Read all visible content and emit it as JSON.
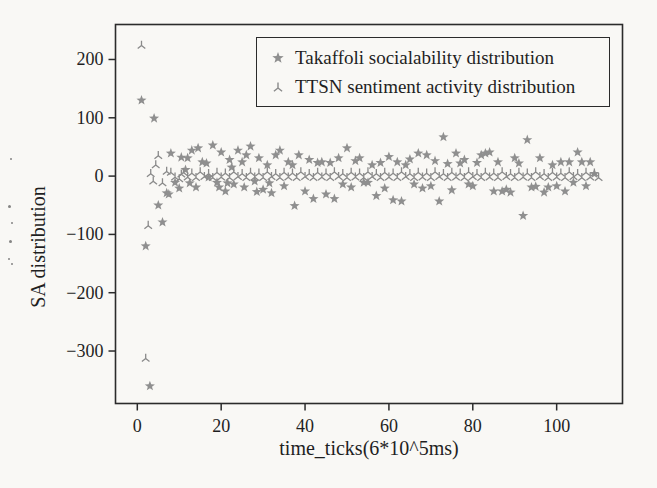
{
  "figure": {
    "background": "#f9f8f5",
    "axis_color": "#2b2b2b",
    "text_color": "#1f1f1f"
  },
  "chart_data": {
    "type": "scatter",
    "title": "",
    "xlabel": "time_ticks(6*10^5ms)",
    "ylabel": "SA distribution",
    "xlim": [
      -5.2,
      115.7
    ],
    "ylim": [
      -390,
      260
    ],
    "xticks": [
      0,
      20,
      40,
      60,
      80,
      100
    ],
    "yticks": [
      200,
      100,
      0,
      -100,
      -200,
      -300
    ],
    "grid": false,
    "legend_position": "upper right",
    "series": [
      {
        "name": "Takaffoli socialability distribution",
        "marker": "star",
        "color": "#8f8f8f",
        "points": [
          [
            1,
            130
          ],
          [
            2,
            -120
          ],
          [
            3,
            -360
          ],
          [
            4,
            99
          ],
          [
            5,
            -50
          ],
          [
            6,
            -79
          ],
          [
            7,
            -29
          ],
          [
            7.5,
            -31
          ],
          [
            8,
            39
          ],
          [
            9,
            -11
          ],
          [
            10,
            -21
          ],
          [
            10.5,
            32
          ],
          [
            11.5,
            11
          ],
          [
            12,
            31
          ],
          [
            12.5,
            -12
          ],
          [
            13,
            44
          ],
          [
            14,
            -19
          ],
          [
            14.5,
            48
          ],
          [
            15.5,
            24
          ],
          [
            16.5,
            22
          ],
          [
            17,
            -2
          ],
          [
            18,
            53
          ],
          [
            19,
            -11
          ],
          [
            19.5,
            -19
          ],
          [
            20,
            41
          ],
          [
            21,
            -26
          ],
          [
            21.5,
            -12
          ],
          [
            22,
            28
          ],
          [
            22.5,
            15
          ],
          [
            23,
            -14
          ],
          [
            24,
            44
          ],
          [
            25,
            24
          ],
          [
            25.5,
            -19
          ],
          [
            26,
            36
          ],
          [
            27,
            51
          ],
          [
            28,
            -9
          ],
          [
            28.5,
            -27
          ],
          [
            29,
            31
          ],
          [
            30,
            -23
          ],
          [
            31,
            19
          ],
          [
            31.5,
            -12
          ],
          [
            32,
            -29
          ],
          [
            33,
            36
          ],
          [
            34,
            44
          ],
          [
            35,
            -17
          ],
          [
            36,
            24
          ],
          [
            37,
            19
          ],
          [
            37.5,
            -51
          ],
          [
            38.5,
            36
          ],
          [
            40,
            -26
          ],
          [
            41,
            28
          ],
          [
            42,
            -39
          ],
          [
            43,
            23
          ],
          [
            44,
            24
          ],
          [
            45,
            -31
          ],
          [
            46,
            23
          ],
          [
            47,
            -39
          ],
          [
            48,
            31
          ],
          [
            49,
            -14
          ],
          [
            50,
            48
          ],
          [
            51,
            -19
          ],
          [
            52,
            26
          ],
          [
            53,
            31
          ],
          [
            54,
            -11
          ],
          [
            55,
            -11
          ],
          [
            56,
            19
          ],
          [
            57,
            -34
          ],
          [
            58,
            23
          ],
          [
            59,
            -21
          ],
          [
            60,
            33
          ],
          [
            61,
            -41
          ],
          [
            62,
            24
          ],
          [
            63,
            -43
          ],
          [
            64,
            19
          ],
          [
            65,
            29
          ],
          [
            66,
            -14
          ],
          [
            67,
            39
          ],
          [
            68,
            -21
          ],
          [
            69,
            36
          ],
          [
            70,
            -17
          ],
          [
            71,
            26
          ],
          [
            72,
            -43
          ],
          [
            73,
            67
          ],
          [
            74,
            21
          ],
          [
            75,
            -24
          ],
          [
            76,
            39
          ],
          [
            77,
            22
          ],
          [
            78,
            28
          ],
          [
            79,
            -14
          ],
          [
            80,
            -17
          ],
          [
            81,
            23
          ],
          [
            82,
            36
          ],
          [
            83,
            39
          ],
          [
            84,
            41
          ],
          [
            85,
            -26
          ],
          [
            86,
            24
          ],
          [
            87,
            -26
          ],
          [
            88,
            -23
          ],
          [
            89,
            -28
          ],
          [
            90,
            31
          ],
          [
            91,
            22
          ],
          [
            92,
            -68
          ],
          [
            93,
            62
          ],
          [
            94,
            -19
          ],
          [
            95,
            -18
          ],
          [
            96,
            31
          ],
          [
            97,
            -28
          ],
          [
            98,
            -19
          ],
          [
            99,
            19
          ],
          [
            100,
            -17
          ],
          [
            101,
            24
          ],
          [
            102,
            -26
          ],
          [
            103,
            24
          ],
          [
            104,
            -11
          ],
          [
            105,
            41
          ],
          [
            106,
            24
          ],
          [
            107,
            -17
          ],
          [
            108,
            24
          ],
          [
            109,
            4
          ]
        ]
      },
      {
        "name": "TTSN sentiment activity distribution",
        "marker": "tri_up",
        "color": "#8a8a8a",
        "points": [
          [
            1,
            224
          ],
          [
            2,
            -313
          ],
          [
            2.6,
            -85
          ],
          [
            3.2,
            4
          ],
          [
            3.8,
            -9
          ],
          [
            4.4,
            19
          ],
          [
            5,
            35
          ],
          [
            6,
            -12
          ],
          [
            7,
            8
          ],
          [
            8,
            6
          ],
          [
            9,
            -2
          ],
          [
            10,
            -5
          ],
          [
            10.5,
            3
          ],
          [
            11,
            6
          ],
          [
            12,
            -2
          ],
          [
            13,
            5
          ],
          [
            14,
            -3
          ],
          [
            15,
            7
          ],
          [
            16,
            -1
          ],
          [
            17,
            4
          ],
          [
            18,
            -3
          ],
          [
            19,
            6
          ],
          [
            20,
            -2
          ],
          [
            21,
            5
          ],
          [
            22,
            -3
          ],
          [
            23,
            7
          ],
          [
            24,
            -1
          ],
          [
            25,
            4
          ],
          [
            26,
            -3
          ],
          [
            27,
            6
          ],
          [
            28,
            -2
          ],
          [
            29,
            5
          ],
          [
            30,
            -3
          ],
          [
            31,
            7
          ],
          [
            32,
            -1
          ],
          [
            33,
            4
          ],
          [
            34,
            -3
          ],
          [
            35,
            6
          ],
          [
            36,
            -2
          ],
          [
            37,
            5
          ],
          [
            38,
            -3
          ],
          [
            39,
            7
          ],
          [
            40,
            -1
          ],
          [
            41,
            4
          ],
          [
            42,
            -3
          ],
          [
            43,
            6
          ],
          [
            44,
            -2
          ],
          [
            45,
            5
          ],
          [
            46,
            -3
          ],
          [
            47,
            7
          ],
          [
            48,
            -1
          ],
          [
            49,
            4
          ],
          [
            50,
            -3
          ],
          [
            51,
            6
          ],
          [
            52,
            -2
          ],
          [
            53,
            5
          ],
          [
            54,
            -3
          ],
          [
            55,
            7
          ],
          [
            56,
            -1
          ],
          [
            57,
            4
          ],
          [
            58,
            -3
          ],
          [
            59,
            6
          ],
          [
            60,
            -2
          ],
          [
            61,
            5
          ],
          [
            62,
            -3
          ],
          [
            63,
            7
          ],
          [
            64,
            -1
          ],
          [
            65,
            4
          ],
          [
            66,
            -3
          ],
          [
            67,
            6
          ],
          [
            68,
            -2
          ],
          [
            69,
            5
          ],
          [
            70,
            -3
          ],
          [
            71,
            7
          ],
          [
            72,
            -1
          ],
          [
            73,
            4
          ],
          [
            74,
            -3
          ],
          [
            75,
            6
          ],
          [
            76,
            -2
          ],
          [
            77,
            5
          ],
          [
            78,
            -3
          ],
          [
            79,
            7
          ],
          [
            80,
            -1
          ],
          [
            81,
            4
          ],
          [
            82,
            -3
          ],
          [
            83,
            6
          ],
          [
            84,
            -2
          ],
          [
            85,
            5
          ],
          [
            86,
            -3
          ],
          [
            87,
            7
          ],
          [
            88,
            -1
          ],
          [
            89,
            4
          ],
          [
            90,
            -3
          ],
          [
            91,
            6
          ],
          [
            92,
            -2
          ],
          [
            93,
            5
          ],
          [
            94,
            -3
          ],
          [
            95,
            7
          ],
          [
            96,
            -1
          ],
          [
            97,
            4
          ],
          [
            98,
            -3
          ],
          [
            99,
            6
          ],
          [
            100,
            -2
          ],
          [
            101,
            5
          ],
          [
            102,
            -3
          ],
          [
            103,
            7
          ],
          [
            104,
            -1
          ],
          [
            105,
            4
          ],
          [
            106,
            -3
          ],
          [
            107,
            6
          ],
          [
            108,
            -2
          ],
          [
            109,
            5
          ],
          [
            110,
            -3
          ]
        ]
      }
    ]
  },
  "artifacts": {
    "specks": [
      {
        "x": 10,
        "y": 158,
        "s": 2
      },
      {
        "x": 8,
        "y": 205,
        "s": 3
      },
      {
        "x": 11,
        "y": 222,
        "s": 2
      },
      {
        "x": 9,
        "y": 240,
        "s": 3
      },
      {
        "x": 8,
        "y": 258,
        "s": 2
      },
      {
        "x": 11,
        "y": 263,
        "s": 2
      }
    ]
  }
}
